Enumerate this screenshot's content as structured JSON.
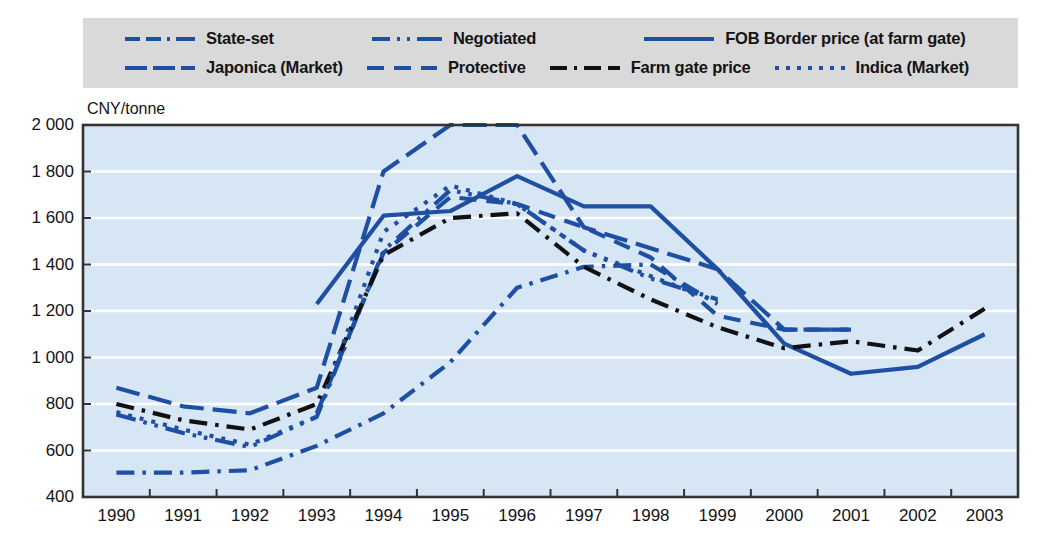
{
  "legend": {
    "rows": [
      [
        {
          "key": "state_set",
          "label": "State-set",
          "style": "dash-dot-blue",
          "color": "#1f4fa3"
        },
        {
          "key": "negotiated",
          "label": "Negotiated",
          "style": "dash-dotdot-blue",
          "color": "#1f4fa3"
        },
        {
          "key": "fob_border",
          "label": "FOB Border price (at farm gate)",
          "style": "solid-blue",
          "color": "#1f4fa3"
        }
      ],
      [
        {
          "key": "japonica",
          "label": "Japonica (Market)",
          "style": "long-dash-blue",
          "color": "#1f4fa3"
        },
        {
          "key": "protective",
          "label": "Protective",
          "style": "dash-blue",
          "color": "#1f4fa3"
        },
        {
          "key": "farm_gate",
          "label": "Farm gate price",
          "style": "dash-dot-black",
          "color": "#111111"
        },
        {
          "key": "indica",
          "label": "Indica (Market)",
          "style": "dotted-blue",
          "color": "#1f4fa3"
        }
      ]
    ]
  },
  "axis": {
    "unit_label": "CNY/tonne",
    "panel_label": "Rice unmilled",
    "y_ticks": [
      400,
      600,
      800,
      1000,
      1200,
      1400,
      1600,
      1800,
      2000
    ],
    "y_tick_labels": [
      "400",
      "600",
      "800",
      "1 000",
      "1 200",
      "1 400",
      "1 600",
      "1 800",
      "2 000"
    ],
    "x_ticks": [
      1990,
      1991,
      1992,
      1993,
      1994,
      1995,
      1996,
      1997,
      1998,
      1999,
      2000,
      2001,
      2002,
      2003
    ]
  },
  "colors": {
    "plot_background": "#d6e6f5",
    "gridline": "#ffffff",
    "axis": "#333333",
    "blue": "#1f4fa3",
    "black": "#111111",
    "legend_background": "#d9d9d9"
  },
  "chart_data": {
    "type": "line",
    "title": "Rice unmilled",
    "xlabel": "",
    "ylabel": "CNY/tonne",
    "xlim": [
      1990,
      2003
    ],
    "ylim": [
      400,
      2000
    ],
    "grid": true,
    "legend_position": "top",
    "x": [
      1990,
      1991,
      1992,
      1993,
      1994,
      1995,
      1996,
      1997,
      1998,
      1999,
      2000,
      2001,
      2002,
      2003
    ],
    "series": [
      {
        "name": "State-set",
        "color": "#1f4fa3",
        "dash": "dash-dot",
        "x": [
          1990,
          1991,
          1992,
          1993,
          1994,
          1995,
          1996,
          1997,
          1998,
          1999
        ],
        "values": [
          505,
          505,
          515,
          620,
          760,
          980,
          1300,
          1390,
          1400,
          1230
        ]
      },
      {
        "name": "Japonica (Market)",
        "color": "#1f4fa3",
        "dash": "long-dash",
        "x": [
          1990,
          1991,
          1992,
          1993,
          1994,
          1995,
          1996,
          1997,
          1998,
          1999,
          2000,
          2001
        ],
        "values": [
          870,
          790,
          760,
          870,
          1800,
          2000,
          2000,
          1560,
          1470,
          1380,
          1120,
          1120
        ]
      },
      {
        "name": "Negotiated",
        "color": "#1f4fa3",
        "dash": "dash-dot-dot",
        "x": [
          1990,
          1991,
          1992,
          1993,
          1994,
          1995,
          1996,
          1997,
          1998,
          1999
        ],
        "values": [
          755,
          675,
          615,
          745,
          1460,
          1720,
          1660,
          1460,
          1340,
          1250
        ]
      },
      {
        "name": "Protective",
        "color": "#1f4fa3",
        "dash": "dash",
        "x": [
          1993,
          1994,
          1995,
          1996,
          1997,
          1998,
          1999,
          2000,
          2001
        ],
        "values": [
          760,
          1450,
          1690,
          1660,
          1560,
          1430,
          1180,
          1120,
          1120
        ]
      },
      {
        "name": "FOB Border price (at farm gate)",
        "color": "#1f4fa3",
        "dash": "solid",
        "x": [
          1993,
          1994,
          1995,
          1996,
          1997,
          1998,
          1999,
          2000,
          2001,
          2002,
          2003
        ],
        "values": [
          1230,
          1610,
          1630,
          1780,
          1650,
          1650,
          1380,
          1060,
          930,
          960,
          1100
        ]
      },
      {
        "name": "Farm gate price",
        "color": "#111111",
        "dash": "dash-dot",
        "x": [
          1990,
          1991,
          1992,
          1993,
          1994,
          1995,
          1996,
          1997,
          1998,
          1999,
          2000,
          2001,
          2002,
          2003
        ],
        "values": [
          800,
          730,
          690,
          800,
          1440,
          1600,
          1620,
          1390,
          1250,
          1130,
          1040,
          1070,
          1030,
          1210
        ]
      },
      {
        "name": "Indica (Market)",
        "color": "#1f4fa3",
        "dash": "dotted",
        "x": [
          1990,
          1991,
          1992,
          1993,
          1994,
          1995,
          1996,
          1997,
          1998,
          1999
        ],
        "values": [
          765,
          690,
          625,
          745,
          1540,
          1740,
          1660,
          1460,
          1350,
          1240
        ]
      }
    ]
  }
}
